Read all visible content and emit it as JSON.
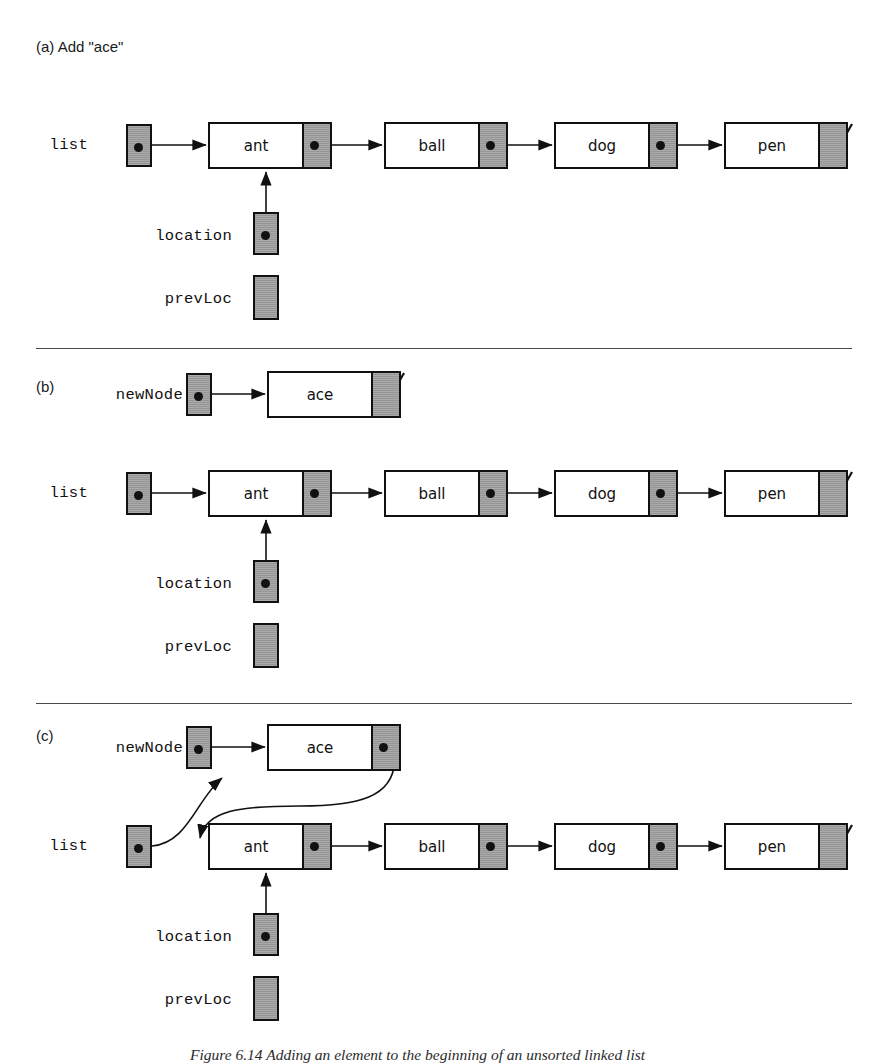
{
  "figure": {
    "caption": "Figure 6.14  Adding an element to the beginning of an unsorted linked list"
  },
  "panels": [
    {
      "id": "a",
      "label": "(a) Add \"ace\"",
      "variables": [
        {
          "name": "list",
          "label": "list",
          "value": "pointer"
        },
        {
          "name": "location",
          "label": "location",
          "value": "pointer"
        },
        {
          "name": "prevLoc",
          "label": "prevLoc",
          "value": "null"
        }
      ],
      "nodes": [
        {
          "data": "ant",
          "next": "ball"
        },
        {
          "data": "ball",
          "next": "dog"
        },
        {
          "data": "dog",
          "next": "pen"
        },
        {
          "data": "pen",
          "next": "null"
        }
      ]
    },
    {
      "id": "b",
      "label": "(b)",
      "variables": [
        {
          "name": "newNode",
          "label": "newNode",
          "value": "pointer"
        },
        {
          "name": "list",
          "label": "list",
          "value": "pointer"
        },
        {
          "name": "location",
          "label": "location",
          "value": "pointer"
        },
        {
          "name": "prevLoc",
          "label": "prevLoc",
          "value": "null"
        }
      ],
      "new_node": {
        "data": "ace",
        "next": "null"
      },
      "nodes": [
        {
          "data": "ant",
          "next": "ball"
        },
        {
          "data": "ball",
          "next": "dog"
        },
        {
          "data": "dog",
          "next": "pen"
        },
        {
          "data": "pen",
          "next": "null"
        }
      ]
    },
    {
      "id": "c",
      "label": "(c)",
      "variables": [
        {
          "name": "newNode",
          "label": "newNode",
          "value": "pointer"
        },
        {
          "name": "list",
          "label": "list",
          "value": "pointer"
        },
        {
          "name": "location",
          "label": "location",
          "value": "pointer"
        },
        {
          "name": "prevLoc",
          "label": "prevLoc",
          "value": "null"
        }
      ],
      "new_node": {
        "data": "ace",
        "next": "ant"
      },
      "nodes": [
        {
          "data": "ant",
          "next": "ball"
        },
        {
          "data": "ball",
          "next": "dog"
        },
        {
          "data": "dog",
          "next": "pen"
        },
        {
          "data": "pen",
          "next": "null"
        }
      ]
    }
  ],
  "colors": {
    "pointer_fill": "#9d9d9d",
    "node_fill": "#ffffff",
    "stroke": "#111111",
    "rule": "#4a4a4a"
  }
}
